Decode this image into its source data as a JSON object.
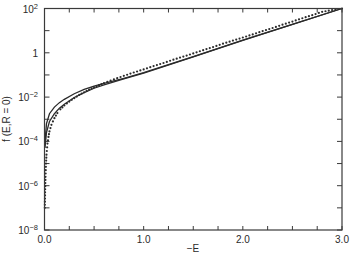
{
  "chart_data": {
    "type": "line",
    "title": "",
    "xlabel": "−E",
    "ylabel": "f (E,R = 0)",
    "xlim": [
      0.0,
      3.0
    ],
    "ylim_log10": [
      -8,
      2
    ],
    "yscale": "log",
    "grid": false,
    "legend": "none",
    "x_ticks": [
      {
        "value": 0.0,
        "label": "0.0"
      },
      {
        "value": 1.0,
        "label": "1.0"
      },
      {
        "value": 2.0,
        "label": "2.0"
      },
      {
        "value": 3.0,
        "label": "3.0"
      }
    ],
    "x_minor_step": 0.25,
    "y_ticks": [
      {
        "log10": 2,
        "base": "10",
        "exp": "2"
      },
      {
        "log10": 0,
        "base": "1",
        "exp": ""
      },
      {
        "log10": -2,
        "base": "10",
        "exp": "−2"
      },
      {
        "log10": -4,
        "base": "10",
        "exp": "−4"
      },
      {
        "log10": -6,
        "base": "10",
        "exp": "−6"
      },
      {
        "log10": -8,
        "base": "10",
        "exp": "−8"
      }
    ],
    "y_minor_log10": [
      1,
      -1,
      -3,
      -5,
      -7
    ],
    "series": [
      {
        "name": "upper-solid",
        "style": "solid",
        "x": [
          0.005,
          0.02,
          0.05,
          0.1,
          0.15,
          0.2,
          0.3,
          0.4,
          0.5,
          0.6,
          0.8,
          1.0,
          1.5,
          2.0,
          2.5,
          3.0
        ],
        "log10_y": [
          -4.0,
          -3.2,
          -2.75,
          -2.45,
          -2.25,
          -2.1,
          -1.85,
          -1.65,
          -1.5,
          -1.38,
          -1.15,
          -0.9,
          -0.17,
          0.57,
          1.28,
          2.0
        ]
      },
      {
        "name": "middle-solid",
        "style": "solid",
        "x": [
          0.005,
          0.02,
          0.05,
          0.1,
          0.15,
          0.2,
          0.3,
          0.4,
          0.5,
          0.6,
          0.8,
          1.0,
          1.5,
          2.0,
          2.5,
          3.0
        ],
        "log10_y": [
          -4.3,
          -3.6,
          -3.1,
          -2.75,
          -2.5,
          -2.32,
          -2.02,
          -1.8,
          -1.6,
          -1.45,
          -1.18,
          -0.92,
          -0.18,
          0.56,
          1.28,
          2.0
        ]
      },
      {
        "name": "dotted",
        "style": "dotted",
        "x": [
          0.003,
          0.006,
          0.01,
          0.015,
          0.02,
          0.03,
          0.04,
          0.05,
          0.07,
          0.1,
          0.13,
          0.16,
          0.2,
          0.25,
          0.3,
          0.35,
          0.4,
          0.45,
          0.5,
          0.55,
          0.6,
          0.7,
          0.8,
          0.9,
          1.0,
          1.1,
          1.2,
          1.3,
          1.4,
          1.5,
          1.6,
          1.7,
          1.8,
          1.9,
          2.0,
          2.1,
          2.2,
          2.3,
          2.4,
          2.5,
          2.6,
          2.7,
          2.8,
          2.9,
          3.0
        ],
        "log10_y": [
          -7.0,
          -6.3,
          -5.6,
          -5.0,
          -4.6,
          -4.1,
          -3.8,
          -3.55,
          -3.25,
          -2.95,
          -2.72,
          -2.55,
          -2.38,
          -2.2,
          -2.05,
          -1.9,
          -1.78,
          -1.66,
          -1.56,
          -1.46,
          -1.37,
          -1.2,
          -1.04,
          -0.89,
          -0.75,
          -0.6,
          -0.46,
          -0.31,
          -0.17,
          -0.03,
          0.12,
          0.26,
          0.41,
          0.55,
          0.69,
          0.83,
          0.98,
          1.12,
          1.27,
          1.41,
          1.56,
          1.7,
          1.85,
          1.93,
          2.0
        ]
      }
    ]
  }
}
